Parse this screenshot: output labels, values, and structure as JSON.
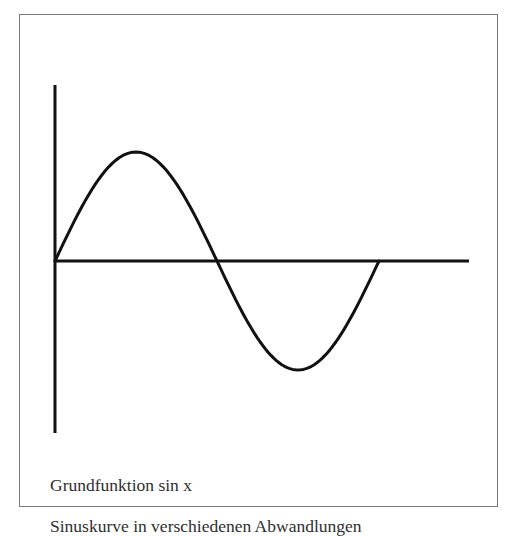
{
  "figure": {
    "frame_label": "Grundfunktion sin x",
    "caption": "Sinuskurve in verschiedenen Abwandlungen"
  },
  "colors": {
    "curve": "#111111",
    "axes": "#111111",
    "frame": "#7a7a7a",
    "text": "#2e2e2e"
  },
  "plot": {
    "function": "sin x",
    "domain": "0 to 2π",
    "x_axis": {
      "shown": true,
      "ticks": [],
      "label": ""
    },
    "y_axis": {
      "shown": true,
      "ticks": [],
      "label": ""
    }
  }
}
